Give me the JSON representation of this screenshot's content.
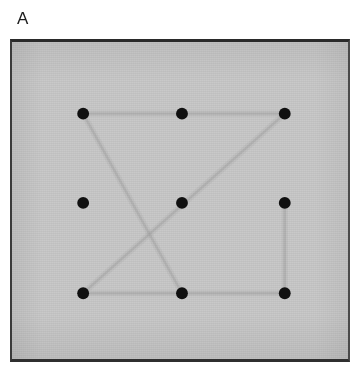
{
  "figure": {
    "panel_label": "A",
    "caption_alt": "Nine-dot array with faint traced connecting path",
    "colors": {
      "page_background": "#ffffff",
      "panel_background": "#c9c9c9",
      "frame_border": "#2a2a2a",
      "dot_color": "#101010",
      "trace_color": "#a3a3a3",
      "label_color": "#1c1c1c"
    },
    "frame": {
      "x": 10,
      "y": 39,
      "width": 340,
      "height": 323,
      "border_width": 3
    }
  },
  "chart_data": {
    "type": "scatter",
    "title": "A",
    "xlabel": "",
    "ylabel": "",
    "xlim": [
      0,
      340
    ],
    "ylim": [
      0,
      323
    ],
    "grid": false,
    "legend": null,
    "series": [
      {
        "name": "dot-array",
        "marker": "filled-circle",
        "marker_radius": 6,
        "color": "#101010",
        "points": [
          {
            "id": "top-left",
            "row": 0,
            "col": 0,
            "x": 72,
            "y": 73
          },
          {
            "id": "top-center",
            "row": 0,
            "col": 1,
            "x": 172,
            "y": 73
          },
          {
            "id": "top-right",
            "row": 0,
            "col": 2,
            "x": 276,
            "y": 73
          },
          {
            "id": "middle-left",
            "row": 1,
            "col": 0,
            "x": 72,
            "y": 164
          },
          {
            "id": "middle-center",
            "row": 1,
            "col": 1,
            "x": 172,
            "y": 164
          },
          {
            "id": "middle-right",
            "row": 1,
            "col": 2,
            "x": 276,
            "y": 164
          },
          {
            "id": "bottom-left",
            "row": 2,
            "col": 0,
            "x": 72,
            "y": 256
          },
          {
            "id": "bottom-center",
            "row": 2,
            "col": 1,
            "x": 172,
            "y": 256
          },
          {
            "id": "bottom-right",
            "row": 2,
            "col": 2,
            "x": 276,
            "y": 256
          }
        ]
      },
      {
        "name": "traced-path",
        "marker": "none",
        "color": "#a5a5a5",
        "line_width": 2.4,
        "segments": [
          {
            "from": "top-left",
            "to": "top-center",
            "x1": 72,
            "y1": 73,
            "x2": 172,
            "y2": 73
          },
          {
            "from": "top-center",
            "to": "top-right",
            "x1": 172,
            "y1": 73,
            "x2": 276,
            "y2": 73
          },
          {
            "from": "top-left",
            "to": "bottom-center",
            "x1": 72,
            "y1": 73,
            "x2": 172,
            "y2": 256
          },
          {
            "from": "top-right",
            "to": "bottom-left",
            "x1": 276,
            "y1": 73,
            "x2": 72,
            "y2": 256
          },
          {
            "from": "bottom-left",
            "to": "bottom-center",
            "x1": 72,
            "y1": 256,
            "x2": 172,
            "y2": 256
          },
          {
            "from": "bottom-center",
            "to": "bottom-right",
            "x1": 172,
            "y1": 256,
            "x2": 276,
            "y2": 256
          },
          {
            "from": "middle-right",
            "to": "bottom-right",
            "x1": 276,
            "y1": 164,
            "x2": 276,
            "y2": 256
          }
        ]
      }
    ]
  }
}
